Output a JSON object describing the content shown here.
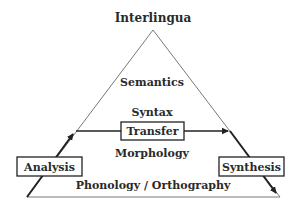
{
  "diagram": {
    "apex_label": "Interlingua",
    "levels": [
      {
        "id": "semantics",
        "label": "Semantics"
      },
      {
        "id": "syntax",
        "label": "Syntax"
      },
      {
        "id": "morphology",
        "label": "Morphology"
      },
      {
        "id": "phonology",
        "label": "Phonology / Orthography"
      }
    ],
    "boxes": {
      "analysis": "Analysis",
      "transfer": "Transfer",
      "synthesis": "Synthesis"
    },
    "colors": {
      "line": "#333333",
      "text": "#2a2a2a",
      "background": "#ffffff"
    }
  }
}
